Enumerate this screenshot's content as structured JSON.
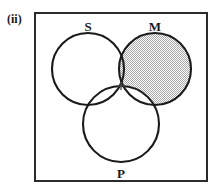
{
  "figure": {
    "number_label": "(ii)",
    "type": "venn-diagram"
  },
  "diagram": {
    "frame": {
      "x": 34,
      "y": 12,
      "width": 174,
      "height": 170,
      "stroke_color": "#2b2b2b",
      "fill_color": "#ffffff",
      "stroke_width": 2
    },
    "circles": [
      {
        "id": "S",
        "label": "S",
        "cx": 88,
        "cy": 69,
        "r": 36,
        "label_x": 88,
        "label_y": 27,
        "shaded": false,
        "stroke_color": "#1a1a1a"
      },
      {
        "id": "M",
        "label": "M",
        "cx": 155,
        "cy": 69,
        "r": 36,
        "label_x": 155,
        "label_y": 27,
        "shaded": true,
        "stroke_color": "#1a1a1a"
      },
      {
        "id": "P",
        "label": "P",
        "cx": 121,
        "cy": 124,
        "r": 38,
        "label_x": 121,
        "label_y": 177,
        "shaded": false,
        "stroke_color": "#1a1a1a"
      }
    ],
    "shading": {
      "region": "M-minus-P",
      "color": "#c9c9c9",
      "pattern": "dither-checker"
    },
    "markers": [
      {
        "symbol": "+",
        "x": 121,
        "y": 87,
        "region": "S-and-M-and-P"
      }
    ]
  }
}
